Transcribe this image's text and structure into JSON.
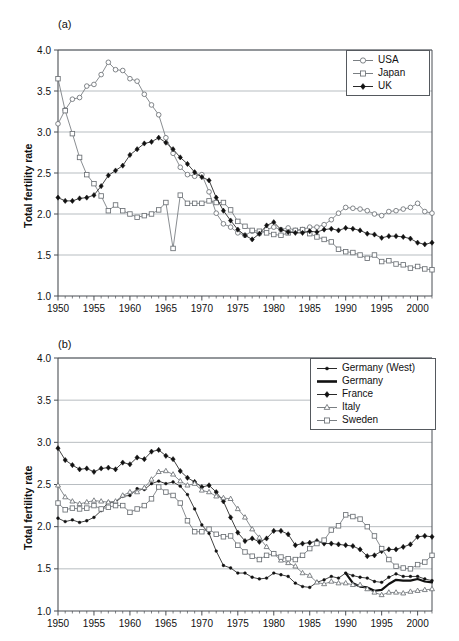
{
  "figure": {
    "ylabel": "Total fertility rate",
    "panel_a_label": "(a)",
    "panel_b_label": "(b)"
  },
  "chart_data": [
    {
      "type": "line",
      "title": "(a)",
      "xlabel": "",
      "ylabel": "Total fertility rate",
      "xlim": [
        1950,
        2002
      ],
      "ylim": [
        1.0,
        4.0
      ],
      "yticks": [
        "1.0",
        "1.5",
        "2.0",
        "2.5",
        "3.0",
        "3.5",
        "4.0"
      ],
      "xticks": [
        "1950",
        "1955",
        "1960",
        "1965",
        "1970",
        "1975",
        "1980",
        "1985",
        "1990",
        "1995",
        "2000"
      ],
      "grid": "horizontal",
      "legend_position": "top-right",
      "x": [
        1950,
        1951,
        1952,
        1953,
        1954,
        1955,
        1956,
        1957,
        1958,
        1959,
        1960,
        1961,
        1962,
        1963,
        1964,
        1965,
        1966,
        1967,
        1968,
        1969,
        1970,
        1971,
        1972,
        1973,
        1974,
        1975,
        1976,
        1977,
        1978,
        1979,
        1980,
        1981,
        1982,
        1983,
        1984,
        1985,
        1986,
        1987,
        1988,
        1989,
        1990,
        1991,
        1992,
        1993,
        1994,
        1995,
        1996,
        1997,
        1998,
        1999,
        2000,
        2001,
        2002
      ],
      "series": [
        {
          "name": "USA",
          "marker": "open-circle",
          "values": [
            3.1,
            3.27,
            3.4,
            3.42,
            3.56,
            3.58,
            3.7,
            3.85,
            3.76,
            3.75,
            3.65,
            3.62,
            3.46,
            3.33,
            3.21,
            2.93,
            2.74,
            2.57,
            2.48,
            2.46,
            2.48,
            2.27,
            2.01,
            1.88,
            1.84,
            1.77,
            1.74,
            1.79,
            1.76,
            1.81,
            1.84,
            1.81,
            1.83,
            1.8,
            1.81,
            1.84,
            1.84,
            1.87,
            1.93,
            2.01,
            2.08,
            2.07,
            2.06,
            2.04,
            2.0,
            1.98,
            2.03,
            2.04,
            2.06,
            2.08,
            2.13,
            2.03,
            2.01
          ]
        },
        {
          "name": "Japan",
          "marker": "open-square",
          "values": [
            3.65,
            3.26,
            2.98,
            2.69,
            2.48,
            2.37,
            2.22,
            2.04,
            2.11,
            2.04,
            2.0,
            1.96,
            1.98,
            2.0,
            2.05,
            2.14,
            1.58,
            2.23,
            2.13,
            2.13,
            2.13,
            2.16,
            2.14,
            2.14,
            2.05,
            1.91,
            1.85,
            1.8,
            1.79,
            1.77,
            1.75,
            1.74,
            1.77,
            1.8,
            1.81,
            1.76,
            1.72,
            1.69,
            1.66,
            1.57,
            1.54,
            1.53,
            1.5,
            1.46,
            1.5,
            1.42,
            1.43,
            1.39,
            1.38,
            1.34,
            1.36,
            1.33,
            1.32
          ]
        },
        {
          "name": "UK",
          "marker": "filled-diamond",
          "values": [
            2.2,
            2.16,
            2.16,
            2.19,
            2.2,
            2.23,
            2.34,
            2.47,
            2.53,
            2.59,
            2.72,
            2.79,
            2.86,
            2.88,
            2.93,
            2.87,
            2.79,
            2.69,
            2.61,
            2.51,
            2.45,
            2.41,
            2.2,
            2.04,
            1.92,
            1.81,
            1.74,
            1.69,
            1.76,
            1.86,
            1.9,
            1.81,
            1.78,
            1.77,
            1.77,
            1.79,
            1.78,
            1.81,
            1.82,
            1.8,
            1.83,
            1.82,
            1.8,
            1.76,
            1.75,
            1.71,
            1.73,
            1.73,
            1.72,
            1.7,
            1.65,
            1.63,
            1.65
          ]
        }
      ]
    },
    {
      "type": "line",
      "title": "(b)",
      "xlabel": "",
      "ylabel": "Total fertility rate",
      "xlim": [
        1950,
        2002
      ],
      "ylim": [
        1.0,
        4.0
      ],
      "yticks": [
        "1.0",
        "1.5",
        "2.0",
        "2.5",
        "3.0",
        "3.5",
        "4.0"
      ],
      "xticks": [
        "1950",
        "1955",
        "1960",
        "1965",
        "1970",
        "1975",
        "1980",
        "1985",
        "1990",
        "1995",
        "2000"
      ],
      "grid": "horizontal",
      "legend_position": "top-right",
      "x": [
        1950,
        1951,
        1952,
        1953,
        1954,
        1955,
        1956,
        1957,
        1958,
        1959,
        1960,
        1961,
        1962,
        1963,
        1964,
        1965,
        1966,
        1967,
        1968,
        1969,
        1970,
        1971,
        1972,
        1973,
        1974,
        1975,
        1976,
        1977,
        1978,
        1979,
        1980,
        1981,
        1982,
        1983,
        1984,
        1985,
        1986,
        1987,
        1988,
        1989,
        1990,
        1991,
        1992,
        1993,
        1994,
        1995,
        1996,
        1997,
        1998,
        1999,
        2000,
        2001,
        2002
      ],
      "series": [
        {
          "name": "Germany (West)",
          "marker": "small-filled-circle",
          "values": [
            2.1,
            2.06,
            2.08,
            2.05,
            2.07,
            2.11,
            2.19,
            2.29,
            2.29,
            2.36,
            2.37,
            2.45,
            2.44,
            2.51,
            2.54,
            2.51,
            2.53,
            2.48,
            2.38,
            2.21,
            2.02,
            1.92,
            1.71,
            1.54,
            1.51,
            1.45,
            1.45,
            1.4,
            1.38,
            1.39,
            1.45,
            1.43,
            1.41,
            1.33,
            1.29,
            1.28,
            1.34,
            1.37,
            1.41,
            1.39,
            1.45,
            1.42,
            1.4,
            1.39,
            1.35,
            1.34,
            1.4,
            1.44,
            1.41,
            1.41,
            1.41,
            1.38,
            1.36
          ]
        },
        {
          "name": "Germany",
          "marker": "thick-line",
          "start_year": 1990,
          "values_by_year": {
            "1990": 1.45,
            "1991": 1.33,
            "1992": 1.29,
            "1993": 1.28,
            "1994": 1.24,
            "1995": 1.25,
            "1996": 1.32,
            "1997": 1.37,
            "1998": 1.36,
            "1999": 1.36,
            "2000": 1.38,
            "2001": 1.35,
            "2002": 1.34
          }
        },
        {
          "name": "France",
          "marker": "filled-diamond",
          "values": [
            2.93,
            2.79,
            2.73,
            2.68,
            2.69,
            2.65,
            2.69,
            2.7,
            2.68,
            2.76,
            2.74,
            2.82,
            2.8,
            2.89,
            2.91,
            2.84,
            2.8,
            2.66,
            2.58,
            2.53,
            2.47,
            2.49,
            2.41,
            2.3,
            2.11,
            1.93,
            1.83,
            1.86,
            1.82,
            1.86,
            1.95,
            1.95,
            1.91,
            1.78,
            1.8,
            1.81,
            1.83,
            1.8,
            1.8,
            1.79,
            1.78,
            1.77,
            1.73,
            1.65,
            1.66,
            1.71,
            1.73,
            1.73,
            1.76,
            1.79,
            1.88,
            1.89,
            1.88
          ]
        },
        {
          "name": "Italy",
          "marker": "open-triangle",
          "values": [
            2.49,
            2.35,
            2.3,
            2.27,
            2.29,
            2.31,
            2.3,
            2.29,
            2.3,
            2.37,
            2.41,
            2.41,
            2.46,
            2.56,
            2.65,
            2.66,
            2.62,
            2.54,
            2.49,
            2.51,
            2.43,
            2.41,
            2.36,
            2.34,
            2.33,
            2.21,
            2.11,
            1.97,
            1.87,
            1.76,
            1.68,
            1.6,
            1.57,
            1.53,
            1.45,
            1.42,
            1.34,
            1.32,
            1.35,
            1.33,
            1.33,
            1.31,
            1.31,
            1.26,
            1.22,
            1.19,
            1.22,
            1.22,
            1.21,
            1.23,
            1.24,
            1.25,
            1.26
          ]
        },
        {
          "name": "Sweden",
          "marker": "open-square",
          "values": [
            2.28,
            2.2,
            2.22,
            2.21,
            2.22,
            2.25,
            2.21,
            2.23,
            2.25,
            2.25,
            2.17,
            2.21,
            2.25,
            2.33,
            2.47,
            2.41,
            2.37,
            2.28,
            2.07,
            1.94,
            1.94,
            1.97,
            1.91,
            1.88,
            1.89,
            1.78,
            1.7,
            1.65,
            1.61,
            1.66,
            1.68,
            1.64,
            1.62,
            1.61,
            1.66,
            1.74,
            1.8,
            1.84,
            1.96,
            2.01,
            2.14,
            2.12,
            2.09,
            2.0,
            1.89,
            1.74,
            1.61,
            1.53,
            1.51,
            1.5,
            1.55,
            1.58,
            1.66
          ]
        }
      ]
    }
  ],
  "panel_a_legend": [
    {
      "label": "USA",
      "marker": "open-circle"
    },
    {
      "label": "Japan",
      "marker": "open-square"
    },
    {
      "label": "UK",
      "marker": "filled-diamond"
    }
  ],
  "panel_b_legend": [
    {
      "label": "Germany (West)",
      "marker": "small-filled-circle"
    },
    {
      "label": "Germany",
      "marker": "thick-line"
    },
    {
      "label": "France",
      "marker": "filled-diamond"
    },
    {
      "label": "Italy",
      "marker": "open-triangle"
    },
    {
      "label": "Sweden",
      "marker": "open-square"
    }
  ],
  "colors": {
    "axis": "#4b4f54",
    "grid": "#9aa0a6",
    "ink": "#111111",
    "open_marker_edge": "#6b7075"
  }
}
